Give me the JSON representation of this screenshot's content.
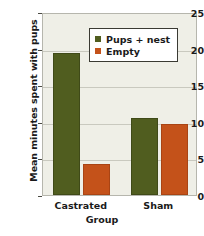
{
  "chart_data": {
    "type": "bar",
    "title": "",
    "xlabel": "Group",
    "ylabel": "Mean minutes spent with pups",
    "categories": [
      "Castrated",
      "Sham"
    ],
    "series": [
      {
        "name": "Pups + nest",
        "color": "#505d1f",
        "values": [
          19.4,
          10.5
        ]
      },
      {
        "name": "Empty",
        "color": "#c4521a",
        "values": [
          4.2,
          9.7
        ]
      }
    ],
    "ylim": [
      0,
      25
    ],
    "yticks": [
      0,
      5,
      10,
      15,
      20,
      25
    ],
    "ytick_labels": [
      "0",
      "5",
      "10",
      "15",
      "20",
      "25"
    ],
    "grid": true,
    "legend_position": "top-center",
    "plot_background": "#efefe7"
  },
  "legend": {
    "items": [
      {
        "label": "Pups + nest",
        "swatch": "green"
      },
      {
        "label": "Empty",
        "swatch": "orange"
      }
    ]
  }
}
